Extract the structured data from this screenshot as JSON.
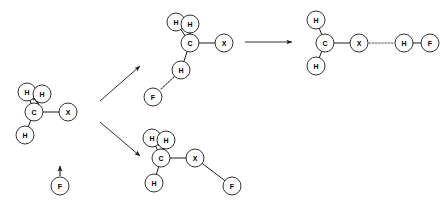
{
  "diagram": {
    "type": "chemical-reaction-scheme",
    "colors": {
      "background": "#ffffff",
      "bond": "#1a1a1a",
      "dotted_bond": "#555555",
      "atom_fill": "#ffffff",
      "label": "#000000"
    },
    "atom_radius": 9.0,
    "labels": {
      "carbon": "C",
      "hydrogen": "H",
      "halogen": "X",
      "fluorine": "F"
    },
    "structures": [
      {
        "id": "reactant",
        "name": "reactant-halomethane",
        "atoms": [
          {
            "id": "r-h1",
            "label": "H",
            "cx": 27,
            "cy": 92,
            "r": 9
          },
          {
            "id": "r-h2",
            "label": "H",
            "cx": 42,
            "cy": 94,
            "r": 9
          },
          {
            "id": "r-c",
            "label": "C",
            "cx": 34,
            "cy": 112,
            "r": 9
          },
          {
            "id": "r-h3",
            "label": "H",
            "cx": 25,
            "cy": 135,
            "r": 9
          },
          {
            "id": "r-x",
            "label": "X",
            "cx": 68,
            "cy": 112,
            "r": 9
          }
        ],
        "bonds": [
          {
            "from": "r-c",
            "to": "r-h1",
            "style": "solid"
          },
          {
            "from": "r-c",
            "to": "r-h2",
            "style": "solid"
          },
          {
            "from": "r-c",
            "to": "r-h3",
            "style": "solid"
          },
          {
            "from": "r-c",
            "to": "r-x",
            "style": "solid"
          }
        ],
        "curly_arrow": {
          "present": true,
          "direction": "up-left",
          "note": "electron pair movement at C-H"
        }
      },
      {
        "id": "fluoride",
        "name": "fluoride-anion",
        "atoms": [
          {
            "id": "f-f",
            "label": "F",
            "cx": 60,
            "cy": 186,
            "r": 9
          }
        ],
        "bonds": [],
        "lone_pair_arrow": {
          "present": true,
          "direction": "up",
          "x": 60,
          "y_from": 175,
          "y_to": 165
        }
      },
      {
        "id": "pathway-a",
        "name": "transition-state-hydrogen-bond",
        "atoms": [
          {
            "id": "a-h1",
            "label": "H",
            "cx": 176,
            "cy": 22,
            "r": 9
          },
          {
            "id": "a-h2",
            "label": "H",
            "cx": 190,
            "cy": 24,
            "r": 9
          },
          {
            "id": "a-c",
            "label": "C",
            "cx": 190,
            "cy": 43,
            "r": 9
          },
          {
            "id": "a-x",
            "label": "X",
            "cx": 224,
            "cy": 43,
            "r": 9
          },
          {
            "id": "a-h3",
            "label": "H",
            "cx": 181,
            "cy": 70,
            "r": 9
          },
          {
            "id": "a-f",
            "label": "F",
            "cx": 153,
            "cy": 97,
            "r": 9
          }
        ],
        "bonds": [
          {
            "from": "a-c",
            "to": "a-h1",
            "style": "solid"
          },
          {
            "from": "a-c",
            "to": "a-h2",
            "style": "solid"
          },
          {
            "from": "a-c",
            "to": "a-h3",
            "style": "solid"
          },
          {
            "from": "a-c",
            "to": "a-x",
            "style": "solid"
          },
          {
            "from": "a-h3",
            "to": "a-f",
            "style": "dotted"
          }
        ],
        "curly_arrow": {
          "present": true,
          "direction": "up-left"
        }
      },
      {
        "id": "pathway-b",
        "name": "product-halogen-fluorine-adduct",
        "atoms": [
          {
            "id": "b-h1",
            "label": "H",
            "cx": 152,
            "cy": 138,
            "r": 9
          },
          {
            "id": "b-h2",
            "label": "H",
            "cx": 166,
            "cy": 140,
            "r": 9
          },
          {
            "id": "b-c",
            "label": "C",
            "cx": 161,
            "cy": 158,
            "r": 9
          },
          {
            "id": "b-h3",
            "label": "H",
            "cx": 154,
            "cy": 183,
            "r": 9
          },
          {
            "id": "b-x",
            "label": "X",
            "cx": 195,
            "cy": 158,
            "r": 9
          },
          {
            "id": "b-f",
            "label": "F",
            "cx": 232,
            "cy": 186,
            "r": 9
          }
        ],
        "bonds": [
          {
            "from": "b-c",
            "to": "b-h1",
            "style": "solid"
          },
          {
            "from": "b-c",
            "to": "b-h2",
            "style": "solid"
          },
          {
            "from": "b-c",
            "to": "b-h3",
            "style": "solid"
          },
          {
            "from": "b-c",
            "to": "b-x",
            "style": "solid"
          },
          {
            "from": "b-x",
            "to": "b-f",
            "style": "solid"
          }
        ],
        "curly_arrow": {
          "present": true,
          "direction": "up-left"
        }
      },
      {
        "id": "product",
        "name": "product-hydrogen-fluoride-complex",
        "atoms": [
          {
            "id": "p-h1",
            "label": "H",
            "cx": 316,
            "cy": 20,
            "r": 9
          },
          {
            "id": "p-c",
            "label": "C",
            "cx": 325,
            "cy": 43,
            "r": 9
          },
          {
            "id": "p-h2",
            "label": "H",
            "cx": 316,
            "cy": 66,
            "r": 9
          },
          {
            "id": "p-x",
            "label": "X",
            "cx": 359,
            "cy": 43,
            "r": 9
          },
          {
            "id": "p-h3",
            "label": "H",
            "cx": 404,
            "cy": 43,
            "r": 9
          },
          {
            "id": "p-f",
            "label": "F",
            "cx": 430,
            "cy": 43,
            "r": 9
          }
        ],
        "bonds": [
          {
            "from": "p-c",
            "to": "p-h1",
            "style": "solid"
          },
          {
            "from": "p-c",
            "to": "p-h2",
            "style": "solid"
          },
          {
            "from": "p-c",
            "to": "p-x",
            "style": "solid"
          },
          {
            "from": "p-x",
            "to": "p-h3",
            "style": "dotted"
          },
          {
            "from": "p-h3",
            "to": "p-f",
            "style": "solid"
          }
        ],
        "curly_arrow": {
          "present": false
        }
      }
    ],
    "reaction_arrows": [
      {
        "id": "arrow-up",
        "name": "reaction-arrow-upper-pathway",
        "x1": 100,
        "y1": 101,
        "x2": 140,
        "y2": 66
      },
      {
        "id": "arrow-down",
        "name": "reaction-arrow-lower-pathway",
        "x1": 100,
        "y1": 122,
        "x2": 140,
        "y2": 156
      },
      {
        "id": "arrow-right",
        "name": "reaction-arrow-to-product",
        "x1": 245,
        "y1": 42,
        "x2": 292,
        "y2": 42
      }
    ]
  }
}
